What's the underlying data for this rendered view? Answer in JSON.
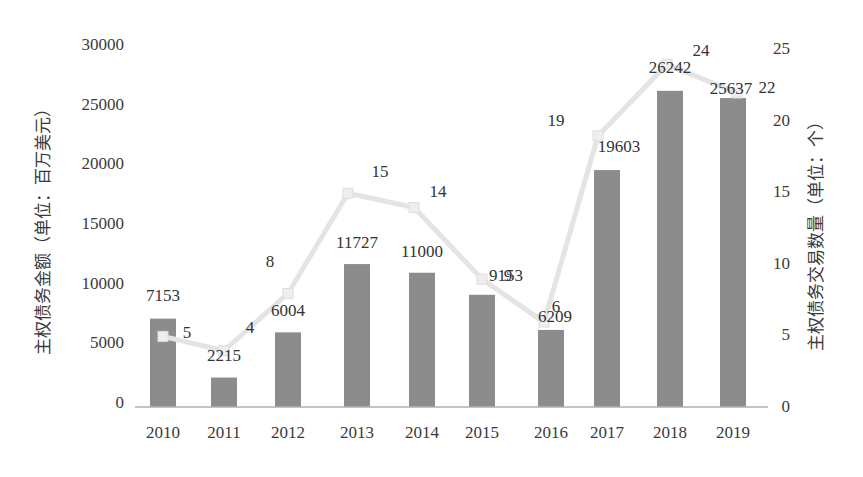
{
  "chart_data": {
    "type": "bar+line",
    "title": "",
    "categories": [
      "2010",
      "2011",
      "2012",
      "2013",
      "2014",
      "2015",
      "2016",
      "2017",
      "2018",
      "2019"
    ],
    "series": [
      {
        "name": "主权债务金额",
        "type": "bar",
        "axis": "left",
        "values": [
          7153,
          2215,
          6004,
          11727,
          11000,
          9153,
          6209,
          19603,
          26242,
          25637
        ],
        "color": "#8c8c8c"
      },
      {
        "name": "主权债务交易数量",
        "type": "line",
        "axis": "right",
        "values": [
          5,
          4,
          8,
          15,
          14,
          9,
          6,
          19,
          24,
          22
        ],
        "color": "#e4e4e4",
        "marker": "square"
      }
    ],
    "ylabel_left": "主权债务金额（单位：百万美元）",
    "ylabel_right": "主权债务交易数量（单位：个）",
    "xlabel": "",
    "ylim_left": [
      0,
      30000
    ],
    "yticks_left": [
      "0",
      "5000",
      "10000",
      "15000",
      "20000",
      "25000",
      "30000"
    ],
    "ylim_right": [
      0,
      25
    ],
    "yticks_right": [
      "0",
      "5",
      "10",
      "15",
      "20",
      "25"
    ],
    "grid": false,
    "legend": null
  }
}
